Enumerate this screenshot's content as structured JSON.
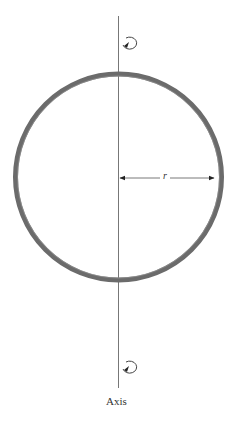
{
  "diagram": {
    "type": "ring rotating about a diameter axis",
    "labels": {
      "axis": "Axis",
      "radius": "r"
    },
    "elements": {
      "ring": {
        "shape": "circle",
        "stroke": "#6b6b6b",
        "thickness": "thick"
      },
      "axis_line": {
        "orientation": "vertical",
        "through": "ring center"
      },
      "rotation_arrows": [
        "top",
        "bottom"
      ],
      "radius_dimension": {
        "from": "center",
        "to": "right edge of ring",
        "double_headed": true
      }
    },
    "colors": {
      "ring": "#6b6b6b",
      "line": "#555555"
    }
  }
}
